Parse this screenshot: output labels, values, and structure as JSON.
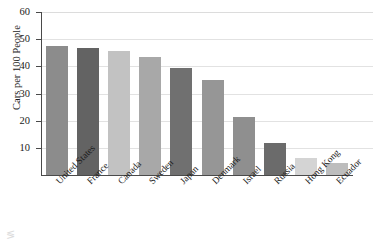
{
  "chart_data": {
    "type": "bar",
    "title": "",
    "xlabel": "",
    "ylabel": "Cars per 100 People",
    "ylim": [
      0,
      60
    ],
    "ytick_values": [
      10,
      20,
      30,
      40,
      50,
      60
    ],
    "ytick_labels": [
      "10",
      "20",
      "30",
      "40",
      "50",
      "60"
    ],
    "grid": true,
    "legend": "none",
    "categories": [
      "United States",
      "France",
      "Canada",
      "Sweden",
      "Japan",
      "Denmark",
      "Israel",
      "Russia",
      "Hong Kong",
      "Ecuador"
    ],
    "values": [
      47.5,
      46.8,
      45.5,
      43.5,
      39.5,
      34.8,
      21.5,
      11.8,
      6.3,
      4.3
    ],
    "bar_colors": [
      "#8c8c8c",
      "#636363",
      "#c2c2c2",
      "#a8a8a8",
      "#707070",
      "#969696",
      "#8f8f8f",
      "#6b6b6b",
      "#d4d4d4",
      "#bdbdbd"
    ],
    "axis_color": "#4a4a4a",
    "grid_color": "#e2e2e2"
  },
  "artifact": {
    "mark": "≶"
  }
}
